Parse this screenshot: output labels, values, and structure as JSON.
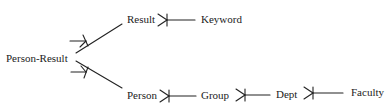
{
  "diagram": {
    "type": "entity-relationship (crow's foot notation)",
    "nodes": [
      {
        "id": "person_result",
        "label": "Person-Result"
      },
      {
        "id": "result",
        "label": "Result"
      },
      {
        "id": "keyword",
        "label": "Keyword"
      },
      {
        "id": "person",
        "label": "Person"
      },
      {
        "id": "group",
        "label": "Group"
      },
      {
        "id": "dept",
        "label": "Dept"
      },
      {
        "id": "faculty",
        "label": "Faculty"
      }
    ],
    "edges": [
      {
        "from": "result",
        "to": "person_result",
        "many_end": "person_result"
      },
      {
        "from": "person",
        "to": "person_result",
        "many_end": "person_result"
      },
      {
        "from": "result",
        "to": "keyword",
        "many_end": "result"
      },
      {
        "from": "person",
        "to": "group",
        "many_end": "person"
      },
      {
        "from": "group",
        "to": "dept",
        "many_end": "group"
      },
      {
        "from": "dept",
        "to": "faculty",
        "many_end": "dept"
      }
    ]
  }
}
